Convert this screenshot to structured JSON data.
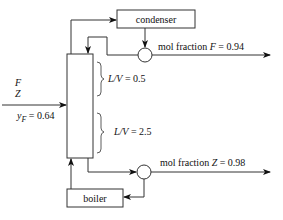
{
  "diagram": {
    "type": "distillation-column",
    "condenser": {
      "label": "condenser"
    },
    "boiler": {
      "label": "boiler"
    },
    "feed": {
      "label_1": "F",
      "label_2": "Z",
      "y_label": "y",
      "y_sub": "F",
      "y_value": " = 0.64"
    },
    "top_product": {
      "prefix": "mol fraction ",
      "var": "F",
      "value": " = 0.94"
    },
    "bottom_product": {
      "prefix": "mol fraction ",
      "var": "Z",
      "value": " = 0.98"
    },
    "upper_section": {
      "ratio_label": "L/V",
      "value": " = 0.5"
    },
    "lower_section": {
      "ratio_label": "L/V",
      "value": " = 2.5"
    }
  }
}
